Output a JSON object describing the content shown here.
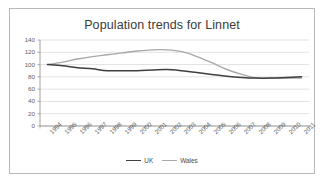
{
  "chart_data": {
    "type": "line",
    "title": "Population trends for Linnet",
    "xlabel": "",
    "ylabel": "",
    "ylim": [
      0,
      140
    ],
    "yticks": [
      0,
      20,
      40,
      60,
      80,
      100,
      120,
      140
    ],
    "grid": true,
    "legend_position": "bottom",
    "categories": [
      "1994",
      "1995",
      "1996",
      "1997",
      "1998",
      "1999",
      "2000",
      "2001",
      "2002",
      "2003",
      "2004",
      "2005",
      "2006",
      "2007",
      "2008",
      "2009",
      "2010",
      "2011"
    ],
    "series": [
      {
        "name": "UK",
        "color": "#3f3f3f",
        "values": [
          100,
          98,
          95,
          93,
          90,
          90,
          90,
          91,
          92,
          90,
          87,
          84,
          81,
          79,
          78,
          78,
          79,
          80
        ]
      },
      {
        "name": "Wales",
        "color": "#a8a8a8",
        "values": [
          100,
          104,
          109,
          113,
          116,
          119,
          122,
          124,
          124,
          121,
          113,
          103,
          92,
          84,
          78,
          78,
          78,
          78
        ]
      }
    ]
  },
  "legend": {
    "items": [
      {
        "label": "UK",
        "color": "#3f3f3f"
      },
      {
        "label": "Wales",
        "color": "#a8a8a8"
      }
    ]
  },
  "axis": {
    "line_color": "#8c8c8c",
    "grid_color": "#d4d4d4"
  }
}
